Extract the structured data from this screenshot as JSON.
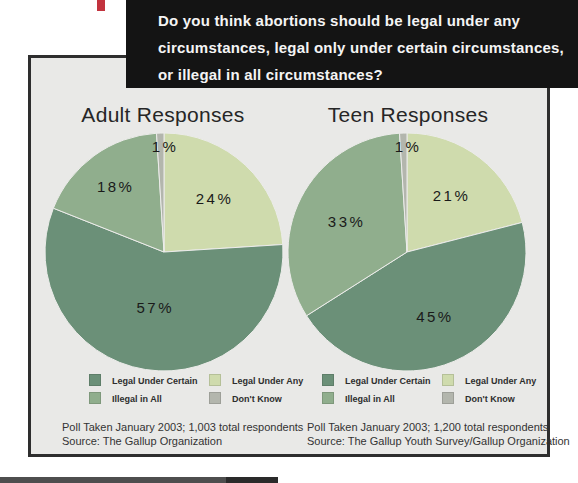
{
  "question_box": {
    "lines": [
      "Do you think abortions should be legal under any",
      "circumstances, legal only under certain circumstances,",
      "or illegal in all circumstances?"
    ]
  },
  "colors": {
    "legal_under_certain": "#6B9078",
    "illegal_in_all": "#90AE8D",
    "legal_under_any": "#CFDBAD",
    "dont_know": "#B3B6AD",
    "accent_red": "#C2333E",
    "panel_bg": "#E9E9E7",
    "panel_border": "#2E2E2E",
    "header_bg": "#141414",
    "header_text": "#F4F4F4"
  },
  "legend": [
    {
      "label": "Legal Under Certain",
      "color_key": "legal_under_certain"
    },
    {
      "label": "Illegal in All",
      "color_key": "illegal_in_all"
    },
    {
      "label": "Legal Under Any",
      "color_key": "legal_under_any"
    },
    {
      "label": "Don't Know",
      "color_key": "dont_know"
    }
  ],
  "chart_data": [
    {
      "id": "adult",
      "type": "pie",
      "title": "Adult Responses",
      "start_angle_deg": 0,
      "direction": "clockwise",
      "slices": [
        {
          "label": "Legal Under Any",
          "value": 24,
          "color_key": "legal_under_any"
        },
        {
          "label": "Legal Under Certain",
          "value": 57,
          "color_key": "legal_under_certain"
        },
        {
          "label": "Illegal in All",
          "value": 18,
          "color_key": "illegal_in_all"
        },
        {
          "label": "Don't Know",
          "value": 1,
          "color_key": "dont_know"
        }
      ],
      "footnotes": [
        "Poll Taken January 2003; 1,003 total respondents",
        "Source: The Gallup Organization"
      ]
    },
    {
      "id": "teen",
      "type": "pie",
      "title": "Teen Responses",
      "start_angle_deg": 0,
      "direction": "clockwise",
      "slices": [
        {
          "label": "Legal Under Any",
          "value": 21,
          "color_key": "legal_under_any"
        },
        {
          "label": "Legal Under Certain",
          "value": 45,
          "color_key": "legal_under_certain"
        },
        {
          "label": "Illegal in All",
          "value": 33,
          "color_key": "illegal_in_all"
        },
        {
          "label": "Don't Know",
          "value": 1,
          "color_key": "dont_know"
        }
      ],
      "footnotes": [
        "Poll Taken January 2003; 1,200 total respondents",
        "Source: The Gallup Youth Survey/Gallup Organization"
      ]
    }
  ]
}
